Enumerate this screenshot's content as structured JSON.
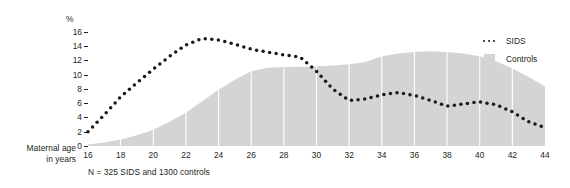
{
  "axes": {
    "x_title_line1": "Maternal age",
    "x_title_line2": "in years",
    "y_unit": "%"
  },
  "footnote": "N = 325 SIDS and 1300 controls",
  "legend": {
    "position": "right",
    "items": [
      {
        "label": "SIDS",
        "marker": "dotted-line",
        "color": "#1a1a1a"
      },
      {
        "label": "Controls",
        "marker": "filled-square",
        "color": "#d4d4d4"
      }
    ]
  },
  "colors": {
    "sids_dots": "#1a1a1a",
    "controls_fill": "#d4d4d4",
    "gridline": "#ffffff",
    "text": "#231f20"
  },
  "chart_data": {
    "type": "line",
    "title": "",
    "subtitle": "",
    "xlabel": "Maternal age in years",
    "ylabel": "%",
    "xlim": [
      16,
      44
    ],
    "ylim": [
      0,
      17
    ],
    "grid": "vertical-white-gridlines-over-area",
    "x_ticks": [
      16,
      18,
      20,
      22,
      24,
      26,
      28,
      30,
      32,
      34,
      36,
      38,
      40,
      42,
      44
    ],
    "y_ticks": [
      0,
      2,
      4,
      6,
      8,
      10,
      12,
      14,
      16
    ],
    "x": [
      16,
      17,
      18,
      19,
      20,
      21,
      22,
      23,
      24,
      25,
      26,
      27,
      28,
      29,
      30,
      31,
      32,
      33,
      34,
      35,
      36,
      37,
      38,
      39,
      40,
      41,
      42,
      43,
      44
    ],
    "series": [
      {
        "name": "SIDS",
        "style": "dotted",
        "values": [
          2.0,
          4.4,
          6.9,
          8.9,
          10.8,
          12.6,
          14.2,
          15.1,
          14.9,
          14.3,
          13.6,
          13.2,
          12.8,
          12.5,
          10.5,
          8.0,
          6.4,
          6.6,
          7.2,
          7.5,
          7.1,
          6.4,
          5.6,
          5.9,
          6.2,
          5.8,
          4.8,
          3.4,
          2.6
        ]
      },
      {
        "name": "Controls",
        "style": "filled-area",
        "values": [
          0.2,
          0.5,
          0.9,
          1.5,
          2.3,
          3.4,
          4.7,
          6.3,
          7.9,
          9.3,
          10.5,
          11.0,
          11.1,
          11.1,
          11.2,
          11.3,
          11.5,
          11.8,
          12.6,
          13.0,
          13.2,
          13.3,
          13.2,
          13.0,
          12.6,
          11.9,
          10.9,
          9.7,
          8.4
        ]
      }
    ],
    "note": "Dotted SIDS curve peaks near 15% at age 23; Controls grey distribution peaks near 13.3% between ages 29 and 31; both decline to under 1% by age 44."
  }
}
